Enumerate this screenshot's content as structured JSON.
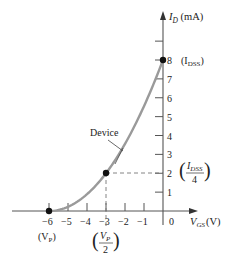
{
  "chart_data": {
    "type": "line",
    "title": "",
    "xlabel": "V_GS (V)",
    "ylabel": "I_D (mA)",
    "xlim": [
      -6,
      0
    ],
    "ylim": [
      0,
      9
    ],
    "grid": false,
    "x_ticks": [
      -6,
      -5,
      -4,
      -3,
      -2,
      -1,
      0
    ],
    "y_ticks": [
      1,
      2,
      3,
      4,
      5,
      6,
      7,
      8
    ],
    "x_tick_labels": [
      "−6",
      "−5",
      "−4",
      "−3",
      "−2",
      "−1",
      "0"
    ],
    "y_tick_labels": [
      "1",
      "2",
      "3",
      "4",
      "5",
      "6",
      "7",
      "8"
    ],
    "series": [
      {
        "name": "Device",
        "color": "#9a9a9a",
        "x": [
          -6,
          -5.5,
          -5,
          -4.5,
          -4,
          -3.5,
          -3,
          -2.5,
          -2,
          -1.5,
          -1,
          -0.5,
          0
        ],
        "y": [
          0,
          0.056,
          0.222,
          0.5,
          0.889,
          1.389,
          2.0,
          2.722,
          3.556,
          4.5,
          5.556,
          6.722,
          8.0
        ]
      }
    ],
    "key_points": [
      {
        "x": -6,
        "y": 0,
        "label": "(V_P)"
      },
      {
        "x": -3,
        "y": 2,
        "label": "(V_P / 2), (I_DSS / 4)"
      },
      {
        "x": 0,
        "y": 8,
        "label": "(I_DSS)"
      }
    ],
    "annotations": [
      {
        "text": "Device",
        "points_to": "curve"
      },
      {
        "text": "(I_DSS)",
        "at": "y=8"
      },
      {
        "text": "(I_DSS / 4)",
        "at": "y=2"
      },
      {
        "text": "(V_P)",
        "at": "x=-6"
      },
      {
        "text": "(V_P / 2)",
        "at": "x=-3"
      }
    ]
  },
  "labels": {
    "y_axis_main": "I",
    "y_axis_sub": "D",
    "y_axis_unit": " (mA)",
    "x_axis_main": "V",
    "x_axis_sub": "GS",
    "x_axis_unit": "(V)",
    "device": "Device",
    "idss_main": "(I",
    "idss_sub": "DSS",
    "idss_close": ")",
    "idss4_num_main": "I",
    "idss4_num_sub": "DSS",
    "idss4_den": "4",
    "vp_main": "(V",
    "vp_sub": "P",
    "vp_close": ")",
    "vp2_num_main": "V",
    "vp2_num_sub": "P",
    "vp2_den": "2"
  },
  "colors": {
    "axis": "#555555",
    "curve": "#9a9a9a",
    "dash": "#777777",
    "point": "#111111"
  }
}
